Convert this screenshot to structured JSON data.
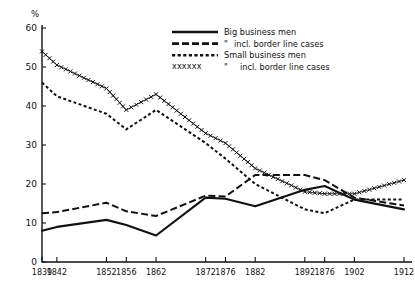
{
  "chart_data": {
    "type": "line",
    "title": "",
    "xlabel": "",
    "ylabel": "%",
    "ylim": [
      0,
      60
    ],
    "ytick_values": [
      0,
      10,
      20,
      30,
      40,
      50,
      60
    ],
    "ytick_labels": [
      "0",
      "10",
      "20",
      "30",
      "40",
      "50",
      "60"
    ],
    "grid": false,
    "legend_position": "top-center",
    "x": [
      1839,
      1842,
      1852,
      1856,
      1862,
      1872,
      1876,
      1882,
      1892,
      1896,
      1902,
      1912
    ],
    "xtick_labels": [
      "1839",
      "1842",
      "1852",
      "1856",
      "1862",
      "1872",
      "1876",
      "1882",
      "1892",
      "1876",
      "1902",
      "1912"
    ],
    "series": [
      {
        "name": "Big business men",
        "style": "solid",
        "values": [
          8.0,
          9.0,
          10.8,
          9.5,
          6.8,
          16.5,
          16.2,
          14.3,
          18.5,
          19.5,
          16.0,
          13.5
        ]
      },
      {
        "name": "\" incl. border line cases",
        "style": "dashed",
        "values": [
          12.5,
          12.8,
          15.2,
          13.0,
          11.8,
          17.0,
          16.8,
          22.3,
          22.3,
          21.0,
          16.5,
          14.5
        ]
      },
      {
        "name": "Small business men",
        "style": "dotted",
        "values": [
          46.0,
          42.5,
          38.0,
          34.0,
          39.0,
          30.5,
          26.5,
          20.0,
          13.5,
          12.5,
          16.0,
          16.0
        ]
      },
      {
        "name": "\"  incl. border line cases",
        "style": "crosses",
        "values": [
          54.0,
          50.5,
          44.5,
          39.0,
          43.0,
          33.0,
          30.5,
          24.0,
          18.0,
          17.5,
          17.5,
          21.0
        ]
      }
    ]
  },
  "axis": {
    "y_axis_unit": "%"
  },
  "legend": {
    "entries": [
      {
        "label": "Big business men",
        "style": "solid",
        "prefix": ""
      },
      {
        "label": "incl. border line cases",
        "style": "dashed",
        "prefix": "\""
      },
      {
        "label": "Small business men",
        "style": "dotted",
        "prefix": ""
      },
      {
        "label": "incl. border line cases",
        "style": "crosses",
        "prefix": "\"",
        "sample_text": "xxxxxx"
      }
    ]
  }
}
